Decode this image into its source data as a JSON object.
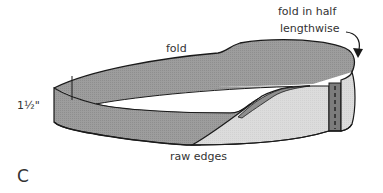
{
  "diagram": {
    "figure_letter": "C",
    "labels": {
      "fold_in_half_line1": "fold in half",
      "fold_in_half_line2": "lengthwise",
      "fold": "fold",
      "width": "1½\"",
      "raw_edges": "raw edges"
    },
    "colors": {
      "band_dark": "#9d9d9d",
      "band_light": "#dcdcdc",
      "seam_strip": "#7c7c7c",
      "outline": "#1a1a1a",
      "text": "#333333"
    }
  }
}
